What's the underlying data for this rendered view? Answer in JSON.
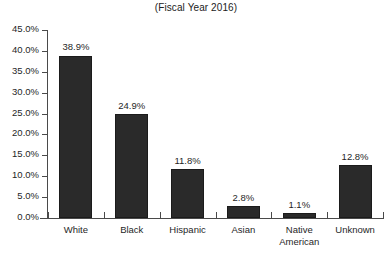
{
  "chart_data": {
    "type": "bar",
    "title": "(Fiscal Year 2016)",
    "xlabel": "",
    "ylabel": "",
    "categories": [
      "White",
      "Black",
      "Hispanic",
      "Asian",
      "Native American",
      "Unknown"
    ],
    "values": [
      38.9,
      24.9,
      11.8,
      2.8,
      1.1,
      12.8
    ],
    "value_labels": [
      "38.9%",
      "24.9%",
      "11.8%",
      "2.8%",
      "1.1%",
      "12.8%"
    ],
    "ylim": [
      0,
      45
    ],
    "ytick_values": [
      45,
      40,
      35,
      30,
      25,
      20,
      15,
      10,
      5,
      0
    ],
    "ytick_labels": [
      "45.0%",
      "40.0%",
      "35.0%",
      "30.0%",
      "25.0%",
      "20.0%",
      "15.0%",
      "10.0%",
      "5.0%",
      "0.0%"
    ],
    "grid": false,
    "legend": null,
    "bar_color": "#2a2a2a",
    "axis_color": "#4a4a4a",
    "background_color": "#ffffff"
  }
}
